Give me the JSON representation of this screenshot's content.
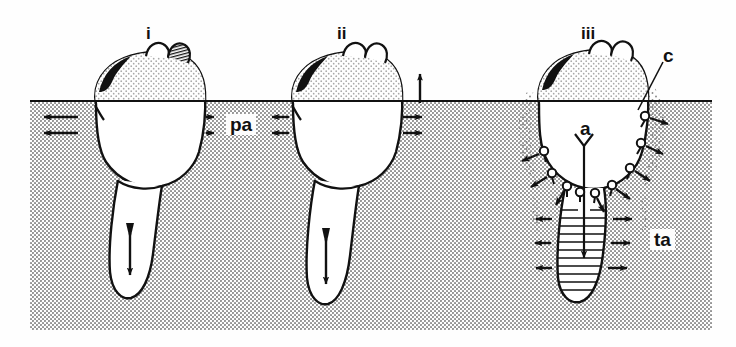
{
  "figure": {
    "panels": [
      {
        "id": "i",
        "roman": "i",
        "x": 150,
        "y": 26,
        "description": "Shell at rest in sediment, foot probing downward, pedal retraction",
        "surface_arrows": {
          "left": "inward",
          "right": "outward",
          "count": 2
        },
        "foot_arrow": "down"
      },
      {
        "id": "ii",
        "roman": "ii",
        "x": 343,
        "y": 26,
        "description": "Shell adduction, water ejected upward at surface, foot extended",
        "surface_arrows": {
          "left": "inward",
          "right": "outward",
          "count": 2
        },
        "vent_arrow": "up",
        "foot_arrow": "down"
      },
      {
        "id": "iii",
        "roman": "iii",
        "x": 590,
        "y": 26,
        "description": "Valve adduction with pedal dilation, sediment fluidised around shell",
        "pin_count": 10,
        "foot_arrows": {
          "left": "outward",
          "right": "outward",
          "count": 3
        },
        "foot_arrow": "down"
      }
    ],
    "annotations": [
      {
        "key": "pa",
        "text": "pa",
        "x": 229,
        "y": 113,
        "meaning": "pedal-anchor / pressure arrows at sediment surface",
        "style": "boxed"
      },
      {
        "key": "c",
        "text": "c",
        "x": 665,
        "y": 48,
        "meaning": "cloud of resuspended sediment",
        "style": "plain",
        "leader": true
      },
      {
        "key": "a",
        "text": "a",
        "x": 584,
        "y": 121,
        "meaning": "adductor muscle",
        "style": "plain"
      },
      {
        "key": "ta",
        "text": "ta",
        "x": 655,
        "y": 228,
        "meaning": "terminal anchor of the foot",
        "style": "boxed"
      }
    ],
    "colors": {
      "ink": "#111111",
      "sediment": "#d7d7d7",
      "sediment_light": "#e9e9e9",
      "shell_fill": "#ffffff",
      "cloud": "#b9b9b9",
      "page": "#ffffff"
    },
    "sediment_block": {
      "x": 30,
      "y": 100,
      "width": 682,
      "height": 230,
      "surface_label": "sediment-water interface"
    }
  }
}
